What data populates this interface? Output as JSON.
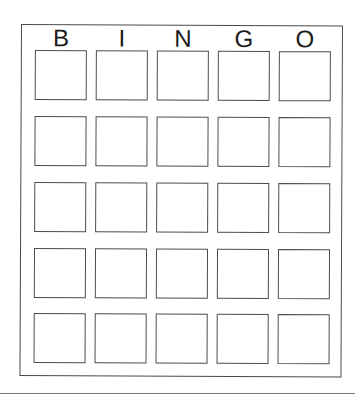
{
  "card": {
    "header": [
      "B",
      "I",
      "N",
      "G",
      "O"
    ],
    "rows": 5,
    "columns": 5,
    "cells": [
      [
        "",
        "",
        "",
        "",
        ""
      ],
      [
        "",
        "",
        "",
        "",
        ""
      ],
      [
        "",
        "",
        "",
        "",
        ""
      ],
      [
        "",
        "",
        "",
        "",
        ""
      ],
      [
        "",
        "",
        "",
        "",
        ""
      ]
    ]
  },
  "colors": {
    "border": "#4d4d4d",
    "text": "#1a1a1a",
    "background": "#ffffff"
  }
}
